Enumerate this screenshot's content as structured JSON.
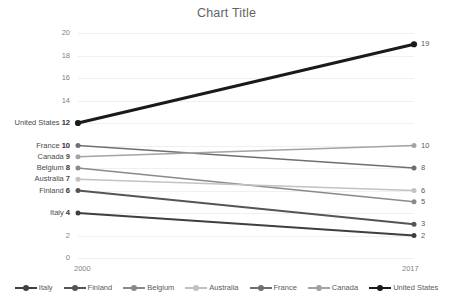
{
  "chart_data": {
    "type": "line",
    "title": "Chart Title",
    "xlabel": "",
    "ylabel": "",
    "categories": [
      "2000",
      "2017"
    ],
    "x": [
      2000,
      2017
    ],
    "xtick_labels": [
      "2000",
      "2017"
    ],
    "ylim": [
      0,
      20
    ],
    "ytick_labels": [
      "0",
      "2",
      "4",
      "6",
      "8",
      "10",
      "12",
      "14",
      "16",
      "18",
      "20"
    ],
    "ytick_values": [
      0,
      2,
      4,
      6,
      8,
      10,
      12,
      14,
      16,
      18,
      20
    ],
    "grid": true,
    "legend_position": "bottom",
    "series": [
      {
        "name": "Italy",
        "values": [
          4,
          2
        ],
        "color": "#3f3f3f",
        "width": 2.0
      },
      {
        "name": "Finland",
        "values": [
          6,
          3
        ],
        "color": "#555555",
        "width": 1.8
      },
      {
        "name": "Belgium",
        "values": [
          8,
          5
        ],
        "color": "#8a8a8a",
        "width": 1.6
      },
      {
        "name": "Australia",
        "values": [
          7,
          6
        ],
        "color": "#c2c2c2",
        "width": 1.6
      },
      {
        "name": "France",
        "values": [
          10,
          8
        ],
        "color": "#6f6f6f",
        "width": 1.6
      },
      {
        "name": "Canada",
        "values": [
          9,
          10
        ],
        "color": "#a3a3a3",
        "width": 1.6
      },
      {
        "name": "United States",
        "values": [
          12,
          19
        ],
        "color": "#1a1a1a",
        "width": 3.0
      }
    ],
    "left_labels": [
      {
        "name": "United States",
        "value": "12",
        "text": "United States 12"
      },
      {
        "name": "France",
        "value": "10",
        "text": "France 10"
      },
      {
        "name": "Canada",
        "value": "9",
        "text": "Canada 9"
      },
      {
        "name": "Belgium",
        "value": "8",
        "text": "Belgium 8"
      },
      {
        "name": "Australia",
        "value": "7",
        "text": "Australia 7"
      },
      {
        "name": "Finland",
        "value": "6",
        "text": "Finland 6"
      },
      {
        "name": "Italy",
        "value": "4",
        "text": "Italy 4"
      }
    ],
    "right_labels": [
      {
        "name": "United States",
        "value": "19"
      },
      {
        "name": "Canada",
        "value": "10"
      },
      {
        "name": "France",
        "value": "8"
      },
      {
        "name": "Australia",
        "value": "6"
      },
      {
        "name": "Belgium",
        "value": "5"
      },
      {
        "name": "Finland",
        "value": "3"
      },
      {
        "name": "Italy",
        "value": "2"
      }
    ],
    "legend": [
      "Italy",
      "Finland",
      "Belgium",
      "Australia",
      "France",
      "Canada",
      "United States"
    ]
  },
  "colors": {
    "background": "#ffffff",
    "gridline": "#f0f0f0",
    "axis_text": "#7f7f7f",
    "title_text": "#636363",
    "label_text": "#4a4a4a"
  }
}
